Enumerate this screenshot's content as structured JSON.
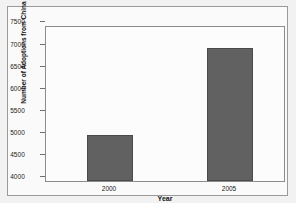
{
  "chart_data": {
    "type": "bar",
    "title": "",
    "categories": [
      "2000",
      "2005"
    ],
    "values": [
      5040,
      7030
    ],
    "series": [
      {
        "name": "Number of Adoptions from China",
        "values": [
          5040,
          7030
        ]
      }
    ],
    "xlabel": "Year",
    "ylabel": "Number of Adoptions from China",
    "ylim": [
      4000,
      7500
    ],
    "ytick_labels": [
      "4000",
      "4500",
      "5000",
      "5500",
      "6000",
      "6500",
      "7000",
      "7500"
    ],
    "ytick_values": [
      4000,
      4500,
      5000,
      5500,
      6000,
      6500,
      7000,
      7500
    ],
    "xtick_labels": [
      "2000",
      "2005"
    ],
    "grid": false,
    "legend": "none",
    "bar_color": "#616161",
    "bar_edge_color": "#4a4a4a",
    "plot_background": "#fcfcfc",
    "figure_background": "#fafafa",
    "frame_color": "#8c8c8c"
  }
}
